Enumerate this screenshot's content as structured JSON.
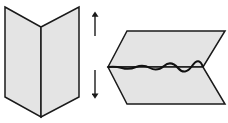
{
  "diagram": {
    "colors": {
      "paper_fill": "#e4e4e4",
      "stroke": "#1a1a1a",
      "background": "#ffffff"
    },
    "folded_paper": {
      "left_panel": "5,7 41,27 41,117 5,97",
      "right_panel": "41,27 79,7 79,97 41,117"
    },
    "arrows": {
      "up": {
        "x": 95,
        "y_tail": 36,
        "y_head": 13
      },
      "down": {
        "x": 95,
        "y_tail": 70,
        "y_head": 97
      }
    },
    "opened_paper": {
      "top_panel": "108,67 127,31 225,31 203,67",
      "bottom_panel": "108,67 203,67 225,104 127,104",
      "crease": "M108,67 Q115,66 122,68 T136,67 T150,68 T164,66 T178,68 T192,66 T203,67"
    }
  }
}
